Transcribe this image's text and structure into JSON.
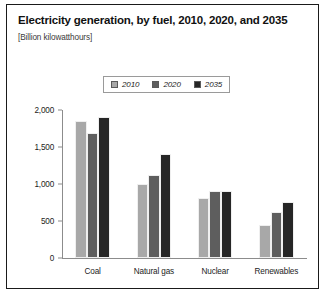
{
  "chart_data": {
    "type": "bar",
    "title": "Electricity generation, by fuel, 2010, 2020, and 2035",
    "subtitle": "[Billion kilowatthours]",
    "xlabel": "",
    "ylabel": "",
    "units": "Billion kilowatthours",
    "categories": [
      "Coal",
      "Natural gas",
      "Nuclear",
      "Renewables"
    ],
    "series": [
      {
        "name": "2010",
        "color": "#a8a8a8",
        "values": [
          1850,
          1000,
          810,
          440
        ]
      },
      {
        "name": "2020",
        "color": "#5e5e5e",
        "values": [
          1690,
          1120,
          900,
          620
        ]
      },
      {
        "name": "2035",
        "color": "#262626",
        "values": [
          1900,
          1400,
          900,
          760
        ]
      }
    ],
    "ylim": [
      0,
      2000
    ],
    "yticks": [
      0,
      500,
      1000,
      1500,
      2000
    ],
    "ytick_labels": [
      "0",
      "500",
      "1,000",
      "1,500",
      "2,000"
    ],
    "grid": false,
    "legend_position": "top-center"
  }
}
